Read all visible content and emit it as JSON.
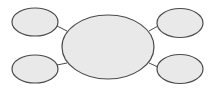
{
  "diagram": {
    "type": "bubble-map",
    "colors": {
      "fill": "#e9e9e9",
      "stroke": "#4a4a4a",
      "connector": "#4a4a4a",
      "background": "#ffffff"
    },
    "center": {
      "cx": 108,
      "cy": 47,
      "rx": 46,
      "ry": 32,
      "label": ""
    },
    "satellites": [
      {
        "id": "top-left",
        "cx": 35,
        "cy": 22,
        "rx": 23,
        "ry": 14,
        "label": "",
        "line": [
          57,
          26,
          67,
          31
        ]
      },
      {
        "id": "bottom-left",
        "cx": 35,
        "cy": 69,
        "rx": 23,
        "ry": 14,
        "label": "",
        "line": [
          57,
          65,
          67,
          63
        ]
      },
      {
        "id": "top-right",
        "cx": 180,
        "cy": 23,
        "rx": 23,
        "ry": 14.5,
        "label": "",
        "line": [
          149,
          31,
          158,
          26
        ]
      },
      {
        "id": "bottom-right",
        "cx": 180,
        "cy": 69,
        "rx": 23,
        "ry": 14.5,
        "label": "",
        "line": [
          149,
          63,
          158,
          67
        ]
      }
    ]
  }
}
